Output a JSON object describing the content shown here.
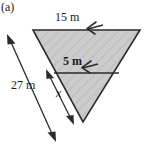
{
  "figure": {
    "part_label": "(a)",
    "shape": "inverted-triangle",
    "fill_color": "#c9c9c9",
    "stroke_color": "#1a1a1a",
    "labels": {
      "top_side": "15 m",
      "inner_line": "5 m",
      "left_side": "27 m",
      "unknown_segment": "x"
    },
    "geometry": {
      "top_left_vertex": [
        33,
        30
      ],
      "top_right_vertex": [
        140,
        30
      ],
      "apex_vertex": [
        83,
        122
      ],
      "inner_line_left": [
        54,
        73
      ],
      "inner_line_right": [
        119,
        73
      ]
    },
    "dimension_arrows": {
      "top_side_arrow": "single-headed-left",
      "inner_line_arrow": "single-headed-left",
      "left_side_arrow": "double-headed",
      "unknown_segment_arrow": "double-headed"
    }
  }
}
